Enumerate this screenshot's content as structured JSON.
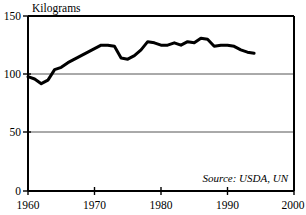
{
  "chart_data": {
    "type": "line",
    "title": "",
    "subtitle": "",
    "xlabel": "",
    "ylabel": "Kilograms",
    "ylabel_position": "top-left-above-axis",
    "xlim": [
      1960,
      2000
    ],
    "ylim": [
      0,
      150
    ],
    "grid": true,
    "grid_axis": "y",
    "legend": false,
    "legend_position": "none",
    "annotations": [
      {
        "text": "Source: USDA, UN",
        "x": 1988,
        "y": 12,
        "style": "italic",
        "align": "right"
      }
    ],
    "xticks": [
      1960,
      1970,
      1980,
      1990,
      2000
    ],
    "xtick_labels": [
      "1960",
      "1970",
      "1980",
      "1990",
      "2000"
    ],
    "yticks": [
      0,
      50,
      100,
      150
    ],
    "ytick_labels": [
      "0",
      "50",
      "100",
      "150"
    ],
    "series": [
      {
        "name": "Kilograms per capita",
        "color": "#000000",
        "x": [
          1960,
          1961,
          1962,
          1963,
          1964,
          1965,
          1966,
          1967,
          1968,
          1969,
          1970,
          1971,
          1972,
          1973,
          1974,
          1975,
          1976,
          1977,
          1978,
          1979,
          1980,
          1981,
          1982,
          1983,
          1984,
          1985,
          1986,
          1987,
          1988,
          1989,
          1990,
          1991,
          1992,
          1993,
          1994
        ],
        "values": [
          98,
          96,
          92,
          95,
          104,
          106,
          110,
          113,
          116,
          119,
          122,
          125,
          125,
          124,
          114,
          113,
          116,
          121,
          128,
          127,
          125,
          125,
          127,
          125,
          128,
          127,
          131,
          130,
          124,
          125,
          125,
          124,
          121,
          119,
          118
        ]
      }
    ]
  },
  "axes": {
    "y_axis_title": "Kilograms",
    "y_tick_0": "0",
    "y_tick_50": "50",
    "y_tick_100": "100",
    "y_tick_150": "150",
    "x_tick_1960": "1960",
    "x_tick_1970": "1970",
    "x_tick_1980": "1980",
    "x_tick_1990": "1990",
    "x_tick_2000": "2000"
  },
  "source_note": {
    "text": "Source: USDA, UN"
  },
  "colors": {
    "series_line": "#000000",
    "frame": "#000000",
    "gridline": "#555555",
    "background": "#ffffff"
  }
}
